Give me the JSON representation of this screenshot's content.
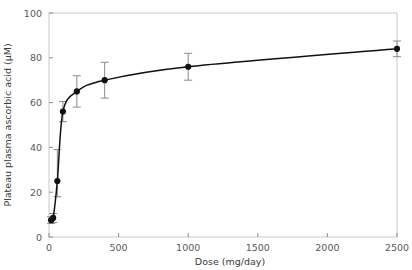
{
  "chart_data": {
    "type": "line",
    "title": "",
    "xlabel": "Dose (mg/day)",
    "ylabel": "Plateau plasma ascorbic acid (µM)",
    "xlim": [
      0,
      2500
    ],
    "ylim": [
      0,
      100
    ],
    "xticks": [
      0,
      500,
      1000,
      1500,
      2000,
      2500
    ],
    "yticks": [
      0,
      20,
      40,
      60,
      80,
      100
    ],
    "xtick_labels": [
      "0",
      "500",
      "1000",
      "1500",
      "2000",
      "2500"
    ],
    "ytick_labels": [
      "0",
      "20",
      "40",
      "60",
      "80",
      "100"
    ],
    "grid": false,
    "legend": false,
    "marker": "filled-circle",
    "errorbars": true,
    "series": [
      {
        "name": "Plateau plasma ascorbic acid",
        "x": [
          15,
          30,
          60,
          100,
          200,
          400,
          1000,
          2500
        ],
        "values": [
          7.5,
          8.5,
          25,
          56,
          65,
          70,
          76,
          84
        ],
        "yerr_low": [
          1.5,
          2.0,
          7.0,
          4.5,
          7.0,
          8.0,
          6.0,
          3.5
        ],
        "yerr_high": [
          1.5,
          2.0,
          14.0,
          4.5,
          7.0,
          8.0,
          6.0,
          3.5
        ]
      }
    ]
  },
  "axis": {
    "x_title": "Dose (mg/day)",
    "y_title": "Plateau plasma ascorbic acid (µM)"
  },
  "colors": {
    "marker": "#111111",
    "curve": "#111111",
    "errorbar": "#8a8a8c",
    "frame": "#c9c9c9",
    "tick_text": "#58585a"
  }
}
